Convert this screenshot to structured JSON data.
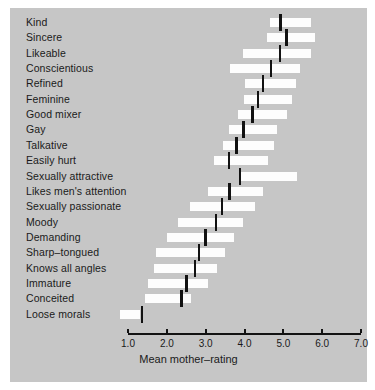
{
  "chart_data": {
    "type": "bar",
    "title": "",
    "xlabel": "Mean mother–rating",
    "ylabel": "",
    "xlim": [
      0.7,
      7.2
    ],
    "ticks": [
      "1.0",
      "2.0",
      "3.0",
      "4.0",
      "5.0",
      "6.0",
      "7.0"
    ],
    "tick_values": [
      1.0,
      2.0,
      3.0,
      4.0,
      5.0,
      6.0,
      7.0
    ],
    "grid": false,
    "legend": null,
    "orientation": "horizontal",
    "note": "Each row is a floating bar (interquartile-style range) with a black median marker.",
    "categories": [
      "Kind",
      "Sincere",
      "Likeable",
      "Conscientious",
      "Refined",
      "Feminine",
      "Good mixer",
      "Gay",
      "Talkative",
      "Easily hurt",
      "Sexually attractive",
      "Likes men's attention",
      "Sexually passionate",
      "Moody",
      "Demanding",
      "Sharp–tongued",
      "Knows all angles",
      "Immature",
      "Conceited",
      "Loose morals"
    ],
    "bar_start": [
      4.65,
      4.58,
      3.95,
      3.63,
      4.02,
      3.98,
      3.83,
      3.6,
      3.45,
      3.22,
      3.9,
      3.05,
      2.6,
      2.3,
      2.0,
      1.72,
      1.68,
      1.52,
      1.45,
      0.79
    ],
    "bar_end": [
      5.72,
      5.82,
      5.7,
      5.42,
      5.32,
      5.22,
      5.1,
      4.83,
      4.75,
      4.6,
      5.35,
      4.48,
      4.27,
      3.96,
      3.72,
      3.5,
      3.28,
      3.05,
      2.62,
      1.32
    ],
    "median": [
      4.93,
      5.08,
      4.92,
      4.68,
      4.48,
      4.35,
      4.2,
      3.98,
      3.8,
      3.6,
      3.88,
      3.62,
      3.42,
      3.26,
      3.0,
      2.83,
      2.72,
      2.5,
      2.38,
      1.36
    ],
    "colors": {
      "panel_background": "#c6c6c6",
      "bar_fill": "#fdfdfd",
      "median_marker": "#121212",
      "axis": "#121212",
      "text": "#1a1a1a"
    }
  }
}
